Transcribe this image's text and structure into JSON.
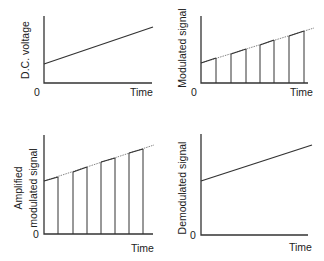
{
  "panels": [
    {
      "id": "dc-voltage",
      "ylabel": "D.C. voltage",
      "xlabel": "Time",
      "origin": "0",
      "type": "line"
    },
    {
      "id": "modulated",
      "ylabel": "Modulated signal",
      "xlabel": "Time",
      "origin": "0",
      "type": "pulses"
    },
    {
      "id": "amplified-modulated",
      "ylabel_line1": "Amplified",
      "ylabel_line2": "modulated signal",
      "xlabel": "Time",
      "origin": "0",
      "type": "pulses"
    },
    {
      "id": "demodulated",
      "ylabel": "Demodulated signal",
      "xlabel": "Time",
      "origin": "0",
      "type": "line"
    }
  ],
  "colors": {
    "ink": "#333333",
    "background": "#ffffff"
  }
}
